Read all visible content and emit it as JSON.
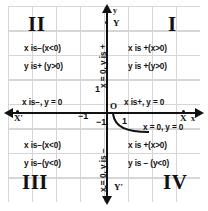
{
  "diagram": {
    "background": "#ffffff",
    "grid_color": "#cfcfcf",
    "axis_color": "#111111"
  },
  "quadrants": {
    "one": {
      "numeral": "I",
      "x_rule": "x  is +(x>0)",
      "y_rule": "y  is +(y>0)"
    },
    "two": {
      "numeral": "II",
      "x_rule": "x is−(x<0)",
      "y_rule": "y is+ (y>0)"
    },
    "three": {
      "numeral": "III",
      "x_rule": "x is−(x<0)",
      "y_rule": "y is−(y<0)"
    },
    "four": {
      "numeral": "IV",
      "x_rule": "x  is +(x>0)",
      "y_rule": "y  is − (y<0)"
    }
  },
  "axes": {
    "y_top_label": "y",
    "y_top_label2": "Y",
    "y_bottom_label": "Y′",
    "x_right_label": "X",
    "x_right_label2": "x",
    "x_left_label": "X′",
    "origin_label": "O",
    "positive_y_rule": "x = 0, y is +",
    "negative_y_rule": "x = 0, y is −",
    "positive_x_rule": "x is+, y = 0",
    "negative_x_rule": "x is−, y = 0",
    "origin_rule": "x = 0, y = 0"
  },
  "ticks": {
    "y_positive_one": "1",
    "y_negative_one": "−1",
    "x_positive_one": "1",
    "x_negative_one": "−1"
  }
}
